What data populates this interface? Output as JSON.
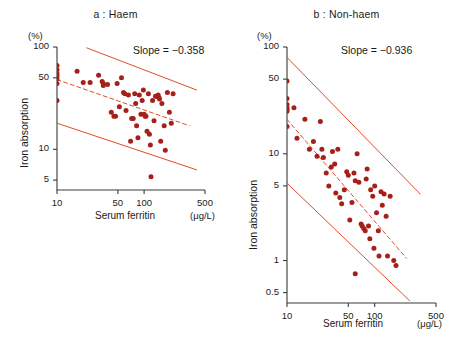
{
  "figure": {
    "width": 462,
    "height": 342,
    "background": "#ffffff",
    "point_color": "#a52019",
    "line_color": "#e24b2a",
    "axis_color": "#3a3a3a",
    "text_color": "#1a1a1a"
  },
  "chart_data": [
    {
      "id": "panel-a",
      "type": "scatter",
      "title": "a : Haem",
      "xlabel": "Serum ferritin",
      "xunit": "(μg/L)",
      "ylabel": "Iron absorption",
      "yunit": "(%)",
      "annotation": "Slope = −0.358",
      "slope": -0.358,
      "xscale": "log",
      "yscale": "log",
      "xlim": [
        10,
        500
      ],
      "ylim": [
        4,
        100
      ],
      "xticks": [
        10,
        50,
        100,
        500
      ],
      "xticklabels": [
        "10",
        "50",
        "100",
        "500"
      ],
      "yticks": [
        100,
        50,
        10,
        5
      ],
      "yticklabels": [
        "100",
        "50",
        "10",
        "5"
      ],
      "grid": false,
      "legend": "none",
      "regression_line": {
        "style": "dashed",
        "x": [
          10,
          330
        ],
        "y": [
          48,
          17
        ]
      },
      "ci_upper_line": {
        "style": "solid",
        "x": [
          22,
          400
        ],
        "y": [
          98,
          38
        ]
      },
      "ci_lower_line": {
        "style": "solid",
        "x": [
          10,
          400
        ],
        "y": [
          18,
          6.3
        ]
      },
      "points": [
        [
          10,
          66
        ],
        [
          10,
          60
        ],
        [
          10,
          55
        ],
        [
          10,
          52
        ],
        [
          10,
          49
        ],
        [
          10,
          44
        ],
        [
          10,
          30
        ],
        [
          17,
          58
        ],
        [
          20,
          45
        ],
        [
          24,
          45
        ],
        [
          30,
          53
        ],
        [
          33,
          46
        ],
        [
          34,
          44
        ],
        [
          34,
          42
        ],
        [
          38,
          43
        ],
        [
          42,
          23
        ],
        [
          45,
          21
        ],
        [
          47,
          21
        ],
        [
          49,
          44
        ],
        [
          52,
          26
        ],
        [
          55,
          50
        ],
        [
          58,
          36
        ],
        [
          60,
          35
        ],
        [
          62,
          24
        ],
        [
          66,
          34
        ],
        [
          70,
          12
        ],
        [
          72,
          20
        ],
        [
          75,
          20
        ],
        [
          78,
          35
        ],
        [
          80,
          28
        ],
        [
          82,
          17
        ],
        [
          85,
          13
        ],
        [
          88,
          34
        ],
        [
          92,
          22
        ],
        [
          95,
          30
        ],
        [
          98,
          38
        ],
        [
          100,
          22
        ],
        [
          103,
          21
        ],
        [
          105,
          21
        ],
        [
          108,
          15
        ],
        [
          112,
          35
        ],
        [
          115,
          14
        ],
        [
          118,
          11
        ],
        [
          120,
          5.4
        ],
        [
          125,
          30
        ],
        [
          130,
          19
        ],
        [
          135,
          33
        ],
        [
          140,
          33
        ],
        [
          145,
          34
        ],
        [
          148,
          32
        ],
        [
          150,
          31
        ],
        [
          155,
          12
        ],
        [
          160,
          28
        ],
        [
          170,
          17
        ],
        [
          175,
          9.8
        ],
        [
          185,
          36
        ],
        [
          195,
          23
        ],
        [
          205,
          18
        ],
        [
          215,
          35
        ]
      ]
    },
    {
      "id": "panel-b",
      "type": "scatter",
      "title": "b : Non-haem",
      "xlabel": "Serum ferritin",
      "xunit": "(μg/L)",
      "ylabel": "Iron absorption",
      "yunit": "(%)",
      "annotation": "Slope = −0.936",
      "slope": -0.936,
      "xscale": "log",
      "yscale": "log",
      "xlim": [
        10,
        500
      ],
      "ylim": [
        0.4,
        100
      ],
      "xticks": [
        10,
        50,
        100,
        500
      ],
      "xticklabels": [
        "10",
        "50",
        "100",
        "500"
      ],
      "yticks": [
        100,
        50,
        10,
        5,
        1,
        0.5
      ],
      "yticklabels": [
        "100",
        "50",
        "10",
        "5",
        "1",
        "0.5"
      ],
      "grid": false,
      "legend": "none",
      "regression_line": {
        "style": "dashed",
        "x": [
          10,
          230
        ],
        "y": [
          21,
          1.05
        ]
      },
      "ci_upper_line": {
        "style": "solid",
        "x": [
          10,
          330
        ],
        "y": [
          80,
          4.2
        ]
      },
      "ci_lower_line": {
        "style": "solid",
        "x": [
          10,
          250
        ],
        "y": [
          5.3,
          0.42
        ]
      },
      "points": [
        [
          10,
          48
        ],
        [
          10,
          33
        ],
        [
          10,
          29
        ],
        [
          10,
          27
        ],
        [
          10,
          26
        ],
        [
          10,
          25
        ],
        [
          10,
          18
        ],
        [
          12,
          27
        ],
        [
          13,
          14
        ],
        [
          16,
          21
        ],
        [
          18,
          11
        ],
        [
          20,
          13
        ],
        [
          22,
          9.5
        ],
        [
          24,
          20
        ],
        [
          25,
          11
        ],
        [
          26,
          9.2
        ],
        [
          28,
          6.6
        ],
        [
          30,
          5.0
        ],
        [
          32,
          7.5
        ],
        [
          33,
          10.5
        ],
        [
          35,
          8.0
        ],
        [
          36,
          4.3
        ],
        [
          38,
          11
        ],
        [
          40,
          3.9
        ],
        [
          42,
          3.4
        ],
        [
          45,
          4.6
        ],
        [
          48,
          6.8
        ],
        [
          50,
          6.3
        ],
        [
          52,
          2.4
        ],
        [
          55,
          3.5
        ],
        [
          58,
          6.6
        ],
        [
          60,
          5.6
        ],
        [
          63,
          10
        ],
        [
          66,
          5.4
        ],
        [
          70,
          2.2
        ],
        [
          72,
          2.1
        ],
        [
          75,
          2.0
        ],
        [
          78,
          1.9
        ],
        [
          80,
          5.8
        ],
        [
          82,
          7.2
        ],
        [
          85,
          2.1
        ],
        [
          88,
          1.6
        ],
        [
          90,
          4.6
        ],
        [
          95,
          4.0
        ],
        [
          98,
          1.3
        ],
        [
          100,
          5.0
        ],
        [
          105,
          2.8
        ],
        [
          110,
          1.9
        ],
        [
          112,
          1.1
        ],
        [
          118,
          4.4
        ],
        [
          122,
          3.3
        ],
        [
          128,
          4.2
        ],
        [
          135,
          2.6
        ],
        [
          140,
          1.1
        ],
        [
          150,
          4.0
        ],
        [
          165,
          1.0
        ],
        [
          175,
          0.9
        ],
        [
          60,
          0.75
        ]
      ]
    }
  ]
}
